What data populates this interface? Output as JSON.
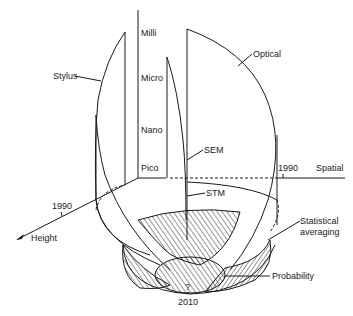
{
  "diagram": {
    "scale_labels": [
      "Milli",
      "Micro",
      "Nano",
      "Pico"
    ],
    "instruments": {
      "stylus": "Stylus",
      "optical": "Optical",
      "sem": "SEM",
      "stm": "STM"
    },
    "axes": {
      "height_label": "Height",
      "spatial_label": "Spatial",
      "height_year": "1990",
      "spatial_year": "1990"
    },
    "regions": {
      "statistical_line1": "Statistical",
      "statistical_line2": "averaging",
      "probability": "Probability"
    },
    "future": {
      "question": "?",
      "year": "2010"
    },
    "colors": {
      "ink": "#1a1a1a",
      "background": "#ffffff"
    }
  }
}
